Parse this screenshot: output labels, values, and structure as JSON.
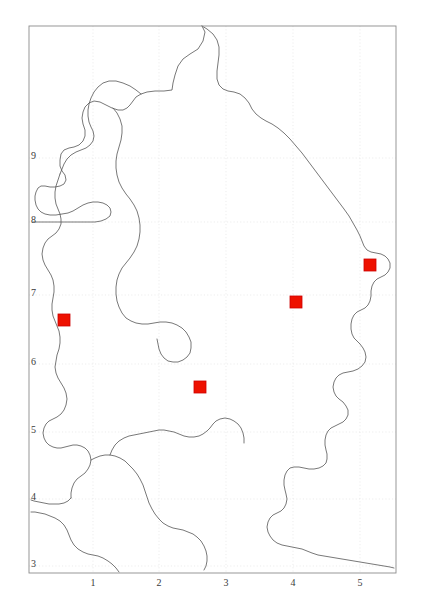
{
  "figure": {
    "type": "distribution-map",
    "background_color": "#ffffff",
    "frame_color": "#808080",
    "coastline_color": "#555555",
    "gridline_color": "#e2e2e2",
    "marker_color": "#ee1100",
    "marker_outline_color": "#cc0000",
    "label_color": "#3a3a3a"
  },
  "plot_frame": {
    "left": 29,
    "top": 26,
    "right": 396,
    "bottom": 573
  },
  "axes": {
    "y_axis": {
      "tick_labels": [
        "9",
        "8",
        "7",
        "6",
        "5",
        "4",
        "3"
      ],
      "tick_positions_px": [
        158,
        222,
        295,
        364,
        432,
        499,
        566
      ],
      "label_x_px": 31
    },
    "x_axis": {
      "tick_labels": [
        "1",
        "2",
        "3",
        "4",
        "5"
      ],
      "tick_positions_px": [
        93,
        159,
        226,
        293,
        360
      ],
      "label_y_px": 578
    }
  },
  "chart_data": {
    "type": "scatter",
    "title": "",
    "xlabel": "",
    "ylabel": "",
    "xlim": [
      0,
      6
    ],
    "ylim": [
      2,
      10
    ],
    "grid": true,
    "xticks": [
      1,
      2,
      3,
      4,
      5
    ],
    "yticks": [
      3,
      4,
      5,
      6,
      7,
      8,
      9
    ],
    "series": [
      {
        "name": "occurrence-records",
        "marker": "square",
        "color": "#ee1100",
        "points_px": [
          {
            "x": 64,
            "y": 320
          },
          {
            "x": 200,
            "y": 387
          },
          {
            "x": 296,
            "y": 302
          },
          {
            "x": 370,
            "y": 265
          }
        ],
        "values": [
          {
            "x": 0.52,
            "y": 6.75
          },
          {
            "x": 2.57,
            "y": 5.77
          },
          {
            "x": 4.05,
            "y": 7.01
          },
          {
            "x": 5.17,
            "y": 7.56
          }
        ]
      }
    ]
  }
}
